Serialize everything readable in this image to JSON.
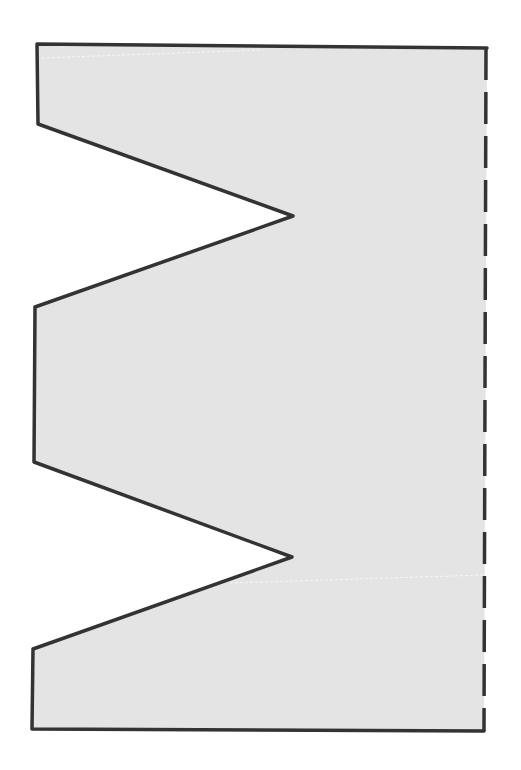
{
  "diagram": {
    "type": "polygon-shape",
    "colors": {
      "fill": "#e4e4e4",
      "stroke": "#333333",
      "background": "#ffffff",
      "faint_line": "#f4f4f4"
    },
    "solid_outline_points": [
      [
        37,
        44
      ],
      [
        487,
        48
      ]
    ],
    "left_outline_points": [
      [
        37,
        44
      ],
      [
        38,
        124
      ],
      [
        293,
        216
      ],
      [
        35,
        307
      ],
      [
        34,
        462
      ],
      [
        292,
        557
      ],
      [
        33,
        649
      ],
      [
        32,
        729
      ],
      [
        484,
        731
      ]
    ],
    "dashed_edge": {
      "from": [
        486,
        48
      ],
      "to": [
        484,
        731
      ],
      "dash": 32,
      "gap": 12
    },
    "faint_lines": [
      {
        "from": [
          42,
          58
        ],
        "to": [
          260,
          50
        ]
      },
      {
        "from": [
          230,
          583
        ],
        "to": [
          484,
          575
        ]
      }
    ]
  }
}
